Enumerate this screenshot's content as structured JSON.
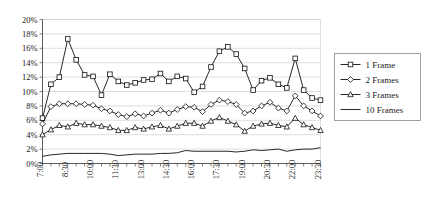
{
  "chart_data": {
    "type": "line",
    "title": "",
    "xlabel": "",
    "ylabel": "",
    "ylim": [
      0,
      20
    ],
    "yticks": [
      0,
      2,
      4,
      6,
      8,
      10,
      12,
      14,
      16,
      18,
      20
    ],
    "ytick_labels": [
      "0%",
      "2%",
      "4%",
      "6%",
      "8%",
      "10%",
      "12%",
      "14%",
      "16%",
      "18%",
      "20%"
    ],
    "grid": true,
    "legend_position": "right",
    "x": [
      "7:00",
      "7:30",
      "8:00",
      "8:30",
      "9:00",
      "9:30",
      "10:00",
      "10:30",
      "11:00",
      "11:30",
      "12:00",
      "12:30",
      "13:00",
      "13:30",
      "14:00",
      "14:30",
      "15:00",
      "15:30",
      "16:00",
      "16:30",
      "17:00",
      "17:30",
      "18:00",
      "18:30",
      "19:00",
      "19:30",
      "20:00",
      "20:30",
      "21:00",
      "21:30",
      "22:00",
      "22:30",
      "23:00",
      "23:30"
    ],
    "xtick_labels": [
      "7:00",
      "8:30",
      "10:00",
      "11:30",
      "13:00",
      "14:30",
      "16:00",
      "17:30",
      "19:00",
      "20:30",
      "22:00",
      "23:30"
    ],
    "xtick_every": 3,
    "series": [
      {
        "name": "1 Frame",
        "marker": "square",
        "values": [
          6.3,
          11.0,
          12.0,
          17.3,
          14.4,
          12.3,
          12.1,
          9.5,
          12.4,
          11.4,
          10.9,
          11.2,
          11.6,
          11.7,
          12.5,
          11.4,
          12.1,
          11.8,
          9.9,
          10.7,
          13.4,
          15.6,
          16.2,
          15.2,
          13.2,
          10.2,
          11.5,
          11.9,
          11.0,
          10.5,
          14.6,
          10.2,
          9.1,
          8.8
        ]
      },
      {
        "name": "2 Frames",
        "marker": "diamond",
        "values": [
          5.5,
          7.9,
          8.3,
          8.3,
          8.3,
          8.2,
          8.1,
          7.6,
          7.3,
          6.8,
          6.5,
          6.9,
          6.6,
          7.0,
          7.4,
          7.0,
          7.5,
          7.9,
          7.8,
          7.2,
          8.2,
          8.8,
          8.6,
          8.2,
          7.0,
          7.3,
          8.0,
          8.5,
          7.7,
          7.3,
          9.4,
          8.0,
          7.3,
          6.6
        ]
      },
      {
        "name": "3 Frames",
        "marker": "triangle",
        "values": [
          4.0,
          4.7,
          5.3,
          5.1,
          5.6,
          5.4,
          5.4,
          5.2,
          5.0,
          4.6,
          4.6,
          5.0,
          4.8,
          5.1,
          5.3,
          4.8,
          5.2,
          5.6,
          5.6,
          5.2,
          5.9,
          6.4,
          5.9,
          5.4,
          4.5,
          5.2,
          5.5,
          5.6,
          5.3,
          5.1,
          6.3,
          5.4,
          5.0,
          4.6
        ]
      },
      {
        "name": "10 Frames",
        "marker": "none",
        "values": [
          1.0,
          1.2,
          1.3,
          1.4,
          1.4,
          1.4,
          1.4,
          1.4,
          1.3,
          1.1,
          1.2,
          1.3,
          1.3,
          1.3,
          1.4,
          1.4,
          1.5,
          1.8,
          1.7,
          1.7,
          1.7,
          1.7,
          1.7,
          1.6,
          1.7,
          1.9,
          1.8,
          1.9,
          2.0,
          1.7,
          1.9,
          2.0,
          2.0,
          2.2
        ]
      }
    ]
  }
}
